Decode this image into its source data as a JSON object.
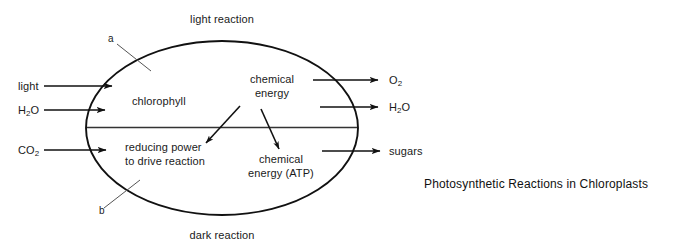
{
  "diagram": {
    "title": "Photosynthetic Reactions in Chloroplasts",
    "top_label": "light reaction",
    "bottom_label": "dark reaction",
    "callouts": [
      {
        "id": "a",
        "label": "a"
      },
      {
        "id": "b",
        "label": "b"
      }
    ],
    "inputs": [
      {
        "id": "light",
        "label": "light",
        "label_html": "light"
      },
      {
        "id": "water",
        "label": "H2O",
        "part1": "H",
        "sub": "2",
        "part2": "O"
      },
      {
        "id": "carbon-dioxide",
        "label": "CO2",
        "part1": "CO",
        "sub": "2",
        "part2": ""
      }
    ],
    "outputs": [
      {
        "id": "oxygen",
        "label": "O2",
        "part1": "O",
        "sub": "2",
        "part2": ""
      },
      {
        "id": "water-out",
        "label": "H2O",
        "part1": "H",
        "sub": "2",
        "part2": "O"
      },
      {
        "id": "sugars",
        "label": "sugars",
        "part1": "sugars",
        "sub": "",
        "part2": ""
      }
    ],
    "interior": {
      "upper_left": "chlorophyll",
      "upper_right_line1": "chemical",
      "upper_right_line2": "energy",
      "lower_left_line1": "reducing power",
      "lower_left_line2": "to drive reaction",
      "lower_right_line1": "chemical",
      "lower_right_line2": "energy (ATP)"
    },
    "colors": {
      "stroke": "#111111",
      "leader": "#555555",
      "background": "#ffffff",
      "text": "#1a1a1a"
    }
  }
}
